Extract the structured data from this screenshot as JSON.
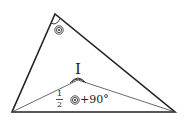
{
  "diagram": {
    "type": "triangle-incenter",
    "vertices": {
      "A": [
        55,
        14
      ],
      "B": [
        12,
        112
      ],
      "C": [
        175,
        112
      ]
    },
    "incenter": {
      "label": "I",
      "pos": [
        78,
        80
      ]
    },
    "apex_angle_mark": "double-circle-dot",
    "annotation": {
      "fraction_num": "1",
      "fraction_den": "2",
      "symbol": "◎",
      "suffix": "+90°"
    }
  }
}
